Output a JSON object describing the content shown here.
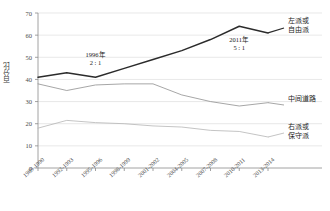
{
  "chart_data": {
    "type": "line",
    "title": "",
    "xlabel": "",
    "ylabel": "百分比",
    "ylim": [
      0,
      70
    ],
    "ytick_values": [
      0,
      10,
      20,
      30,
      40,
      50,
      60,
      70
    ],
    "grid": true,
    "legend_position": "right-inline",
    "categories": [
      "1989-1990",
      "1992-1993",
      "1995-1996",
      "1998-1999",
      "2001-2002",
      "2004-2005",
      "2007-2008",
      "2010-2011",
      "2013-2014"
    ],
    "series": [
      {
        "name": "左派或自由派",
        "label_line1": "左派或",
        "label_line2": "自由派",
        "color": "#2b2b2b",
        "values": [
          41,
          43,
          41,
          45,
          49,
          53,
          58,
          64,
          61
        ]
      },
      {
        "name": "中间道路",
        "label_line1": "中间道路",
        "label_line2": "",
        "color": "#8f8f8f",
        "values": [
          38,
          35,
          37.5,
          38,
          38,
          33,
          30,
          28,
          29.5
        ]
      },
      {
        "name": "右派或保守派",
        "label_line1": "右派或",
        "label_line2": "保守派",
        "color": "#b5b5b5",
        "values": [
          18,
          21.5,
          20.5,
          20,
          19,
          18.5,
          17,
          16.5,
          14
        ]
      }
    ],
    "annotations": [
      {
        "line1": "1996年",
        "line2": "2 : 1",
        "x_index": 2,
        "y_value": 50
      },
      {
        "line1": "2011年",
        "line2": "5 : 1",
        "x_index": 7,
        "y_value": 57
      }
    ]
  },
  "axis": {
    "y_label": "百分比",
    "y_ticks": [
      "70",
      "60",
      "50",
      "40",
      "30",
      "20",
      "10",
      "0"
    ]
  }
}
